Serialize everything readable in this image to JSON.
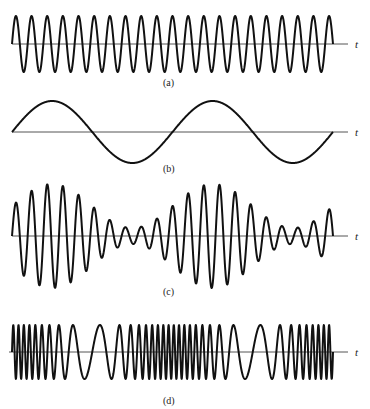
{
  "figure": {
    "axis_label": "t",
    "colors": {
      "wave": "#111111",
      "axis": "#555555",
      "text": "#222222",
      "background": "#ffffff"
    },
    "panels": [
      {
        "id": "a",
        "label": "(a)",
        "title": "Carrier signal"
      },
      {
        "id": "b",
        "label": "(b)",
        "title": "Modulating signal"
      },
      {
        "id": "c",
        "label": "(c)",
        "title": "Amplitude-modulated signal"
      },
      {
        "id": "d",
        "label": "(d)",
        "title": "Frequency-modulated signal"
      }
    ]
  },
  "chart_data": [
    {
      "type": "line",
      "panel": "(a)",
      "description": "Constant-amplitude sinusoidal carrier",
      "xlabel": "t",
      "x_start_px": 12,
      "x_end_px": 333,
      "axis_y_px": 44,
      "axis_end_px": 348,
      "amplitude_px": 28,
      "cycles": 20.5,
      "phase": "sine starting at zero, rising"
    },
    {
      "type": "line",
      "panel": "(b)",
      "description": "Low-frequency modulating sinusoid",
      "xlabel": "t",
      "x_start_px": 12,
      "x_end_px": 333,
      "axis_y_px": 132,
      "axis_end_px": 348,
      "amplitude_px": 31,
      "cycles": 2,
      "phase": "sine starting at zero, rising"
    },
    {
      "type": "line",
      "panel": "(c)",
      "description": "AM signal: carrier (a) with envelope following (b)",
      "xlabel": "t",
      "x_start_px": 12,
      "x_end_px": 333,
      "axis_y_px": 236,
      "axis_end_px": 348,
      "carrier_cycles": 20.5,
      "envelope_mean_px": 30,
      "envelope_swing_px": 22,
      "modulation_cycles": 2
    },
    {
      "type": "line",
      "panel": "(d)",
      "description": "FM signal: instantaneous frequency varies with (b); densest at rising zero-crossings of (b), sparsest at falling zero-crossings",
      "xlabel": "t",
      "x_start_px": 12,
      "x_end_px": 333,
      "axis_y_px": 352,
      "axis_end_px": 348,
      "amplitude_px": 27,
      "mean_cycles": 36,
      "frequency_deviation_ratio": 0.72,
      "modulation_cycles": 2
    }
  ]
}
